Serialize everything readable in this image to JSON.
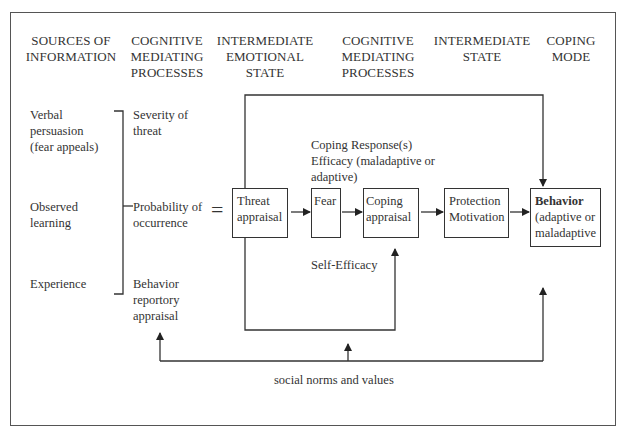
{
  "diagram": {
    "headers": [
      {
        "id": "sources",
        "line1": "SOURCES OF",
        "line2": "INFORMATION",
        "line3": ""
      },
      {
        "id": "cog1",
        "line1": "COGNITIVE",
        "line2": "MEDIATING",
        "line3": "PROCESSES"
      },
      {
        "id": "emotional",
        "line1": "INTERMEDIATE",
        "line2": "EMOTIONAL",
        "line3": "STATE"
      },
      {
        "id": "cog2",
        "line1": "COGNITIVE",
        "line2": "MEDIATING",
        "line3": "PROCESSES"
      },
      {
        "id": "state",
        "line1": "INTERMEDIATE",
        "line2": "STATE",
        "line3": ""
      },
      {
        "id": "coping",
        "line1": "COPING",
        "line2": "MODE",
        "line3": ""
      }
    ],
    "sources": [
      {
        "line1": "Verbal",
        "line2": "persuasion",
        "line3": "(fear appeals)"
      },
      {
        "line1": "Observed",
        "line2": "learning",
        "line3": ""
      },
      {
        "line1": "Experience",
        "line2": "",
        "line3": ""
      }
    ],
    "mediating": [
      {
        "line1": "Severity of",
        "line2": "threat",
        "line3": ""
      },
      {
        "line1": "Probability of",
        "line2": "occurrence",
        "line3": ""
      },
      {
        "line1": "Behavior",
        "line2": "reportory",
        "line3": "appraisal"
      }
    ],
    "equals_sign": "=",
    "nodes": {
      "threat": {
        "line1": "Threat",
        "line2": "appraisal"
      },
      "fear": {
        "line1": "Fear"
      },
      "coping": {
        "line1": "Coping",
        "line2": "appraisal"
      },
      "protection": {
        "line1": "Protection",
        "line2": "Motivation"
      },
      "behavior": {
        "line1": "Behavior",
        "line2": "(adaptive or",
        "line3": "maladaptive"
      }
    },
    "labels": {
      "response_efficacy_1": "Coping Response(s)",
      "response_efficacy_2": "Efficacy (maladaptive or",
      "response_efficacy_3": "adaptive)",
      "self_efficacy": "Self-Efficacy",
      "social_norms": "social norms and values"
    },
    "colors": {
      "line": "#333333",
      "frame": "#555555",
      "background": "#ffffff"
    }
  }
}
